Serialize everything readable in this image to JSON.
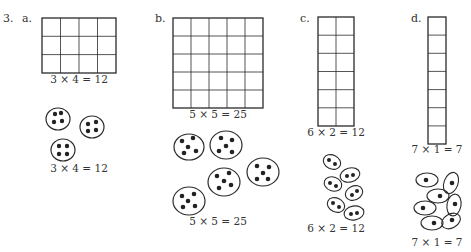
{
  "problem_number": "3.",
  "parts": [
    {
      "letter": "a.",
      "grid": {
        "rows": 3,
        "cols": 4
      },
      "grid_equation": "3 × 4 = 12",
      "groups": {
        "count": 3,
        "dots_per_group": 4
      },
      "groups_equation": "3 × 4 = 12"
    },
    {
      "letter": "b.",
      "grid": {
        "rows": 5,
        "cols": 5
      },
      "grid_equation": "5 × 5 = 25",
      "groups": {
        "count": 5,
        "dots_per_group": 5
      },
      "groups_equation": "5 × 5 = 25"
    },
    {
      "letter": "c.",
      "grid": {
        "rows": 6,
        "cols": 2
      },
      "grid_equation": "6 × 2 = 12",
      "groups": {
        "count": 6,
        "dots_per_group": 2
      },
      "groups_equation": "6 × 2 = 12"
    },
    {
      "letter": "d.",
      "grid": {
        "rows": 7,
        "cols": 1
      },
      "grid_equation": "7 × 1 = 7",
      "groups": {
        "count": 7,
        "dots_per_group": 1
      },
      "groups_equation": "7 × 1 = 7"
    }
  ],
  "colors": {
    "ink": "#2a2a2a",
    "background": "#ffffff"
  }
}
